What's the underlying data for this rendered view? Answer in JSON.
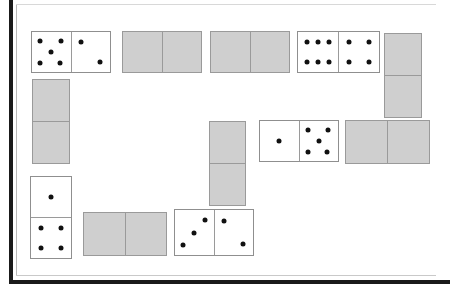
{
  "board": {
    "title": "Dominoes Board",
    "width": 453,
    "height": 287,
    "background_color": "#ffffff",
    "frame_color": "#1a1a1a",
    "facedown_color": "#cfcfcf",
    "domino_face_color": "#ffffff",
    "domino_border_color": "#8f8f8f",
    "pip_color": "#111111",
    "face_up_count": 4,
    "face_down_count": 8,
    "total_dominoes": 12
  },
  "dominoes": [
    {
      "id": "domino-1",
      "name": "domino-5-2",
      "orientation": "horizontal",
      "facedown": false,
      "values": [
        5,
        2
      ],
      "x": 31,
      "y": 31,
      "width": 80,
      "height": 42
    },
    {
      "id": "domino-2",
      "name": "domino-facedown-top-1",
      "orientation": "horizontal",
      "facedown": true,
      "values": [
        null,
        null
      ],
      "x": 122,
      "y": 31,
      "width": 80,
      "height": 42
    },
    {
      "id": "domino-3",
      "name": "domino-facedown-top-2",
      "orientation": "horizontal",
      "facedown": true,
      "values": [
        null,
        null
      ],
      "x": 210,
      "y": 31,
      "width": 80,
      "height": 42
    },
    {
      "id": "domino-4",
      "name": "domino-6-4",
      "orientation": "horizontal",
      "facedown": false,
      "values": [
        6,
        4
      ],
      "x": 297,
      "y": 31,
      "width": 83,
      "height": 42
    },
    {
      "id": "domino-5",
      "name": "domino-facedown-right-vertical",
      "orientation": "vertical",
      "facedown": true,
      "values": [
        null,
        null
      ],
      "x": 384,
      "y": 33,
      "width": 38,
      "height": 85
    },
    {
      "id": "domino-6",
      "name": "domino-facedown-left-vertical",
      "orientation": "vertical",
      "facedown": true,
      "values": [
        null,
        null
      ],
      "x": 32,
      "y": 79,
      "width": 38,
      "height": 85
    },
    {
      "id": "domino-7",
      "name": "domino-facedown-middle-vertical",
      "orientation": "vertical",
      "facedown": true,
      "values": [
        null,
        null
      ],
      "x": 209,
      "y": 121,
      "width": 37,
      "height": 85
    },
    {
      "id": "domino-8",
      "name": "domino-1-5",
      "orientation": "horizontal",
      "facedown": false,
      "values": [
        1,
        5
      ],
      "x": 259,
      "y": 120,
      "width": 80,
      "height": 42
    },
    {
      "id": "domino-9",
      "name": "domino-facedown-right-middle",
      "orientation": "horizontal",
      "facedown": true,
      "values": [
        null,
        null
      ],
      "x": 345,
      "y": 120,
      "width": 85,
      "height": 44
    },
    {
      "id": "domino-10",
      "name": "domino-1-4",
      "orientation": "vertical",
      "facedown": false,
      "values": [
        1,
        4
      ],
      "x": 30,
      "y": 176,
      "width": 42,
      "height": 83
    },
    {
      "id": "domino-11",
      "name": "domino-facedown-bottom-1",
      "orientation": "horizontal",
      "facedown": true,
      "values": [
        null,
        null
      ],
      "x": 83,
      "y": 212,
      "width": 84,
      "height": 44
    },
    {
      "id": "domino-12",
      "name": "domino-3-2",
      "orientation": "horizontal",
      "facedown": false,
      "values": [
        3,
        2
      ],
      "x": 174,
      "y": 209,
      "width": 80,
      "height": 47
    }
  ],
  "pip_layouts": {
    "0": [],
    "1": [
      [
        50,
        50
      ]
    ],
    "2": [
      [
        25,
        25
      ],
      [
        75,
        75
      ]
    ],
    "3": [
      [
        22,
        78
      ],
      [
        50,
        50
      ],
      [
        78,
        22
      ]
    ],
    "4": [
      [
        25,
        25
      ],
      [
        75,
        25
      ],
      [
        25,
        75
      ],
      [
        75,
        75
      ]
    ],
    "5": [
      [
        22,
        22
      ],
      [
        75,
        22
      ],
      [
        50,
        50
      ],
      [
        22,
        78
      ],
      [
        72,
        78
      ]
    ],
    "6": [
      [
        22,
        25
      ],
      [
        50,
        25
      ],
      [
        78,
        25
      ],
      [
        22,
        75
      ],
      [
        50,
        75
      ],
      [
        78,
        75
      ]
    ]
  }
}
